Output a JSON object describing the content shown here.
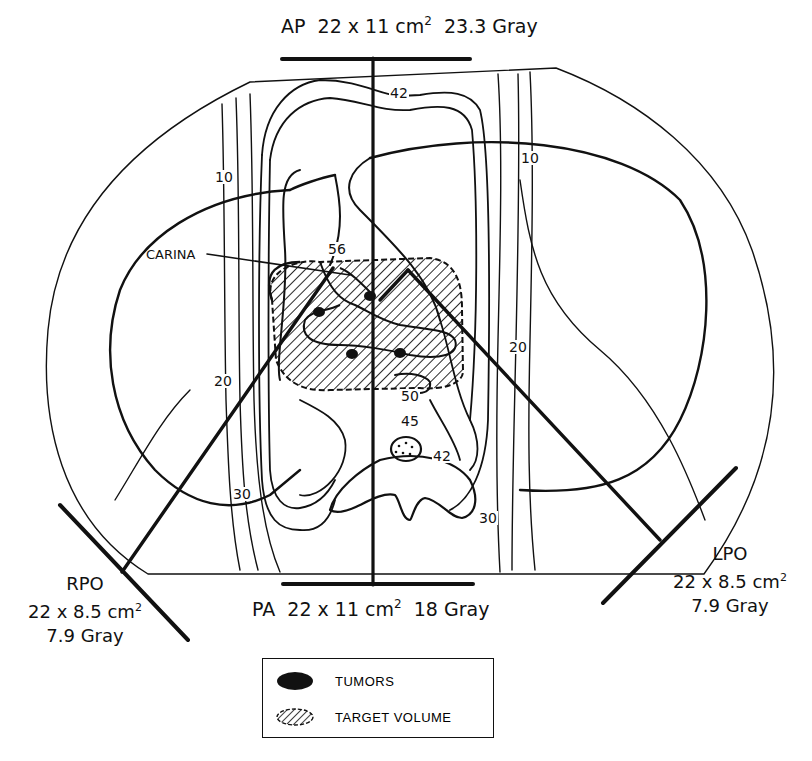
{
  "figure": {
    "type": "radiotherapy isodose plan - axial thoracic cross-section",
    "beams": {
      "ap": {
        "name": "AP",
        "size_prefix": "22 x 11 cm",
        "size_exp": "2",
        "dose": "23.3 Gray"
      },
      "pa": {
        "name": "PA",
        "size_prefix": "22 x 11 cm",
        "size_exp": "2",
        "dose": "18 Gray"
      },
      "rpo": {
        "name": "RPO",
        "size_prefix": "22 x 8.5 cm",
        "size_exp": "2",
        "dose": "7.9 Gray"
      },
      "lpo": {
        "name": "LPO",
        "size_prefix": "22 x 8.5 cm",
        "size_exp": "2",
        "dose": "7.9 Gray"
      }
    },
    "isodose_labels": [
      {
        "id": "top-42",
        "value": "42"
      },
      {
        "id": "left-10",
        "value": "10"
      },
      {
        "id": "right-10",
        "value": "10"
      },
      {
        "id": "left-20",
        "value": "20"
      },
      {
        "id": "right-20",
        "value": "20"
      },
      {
        "id": "center-56",
        "value": "56"
      },
      {
        "id": "spine-50",
        "value": "50"
      },
      {
        "id": "spine-45",
        "value": "45"
      },
      {
        "id": "spine-42",
        "value": "42"
      },
      {
        "id": "left-30",
        "value": "30"
      },
      {
        "id": "right-30",
        "value": "30"
      }
    ],
    "annotations": {
      "carina": "CARINA"
    },
    "legend": {
      "items": [
        {
          "symbol": "solid-ellipse",
          "label": "TUMORS"
        },
        {
          "symbol": "hatched-ellipse",
          "label": "TARGET VOLUME"
        }
      ]
    }
  }
}
